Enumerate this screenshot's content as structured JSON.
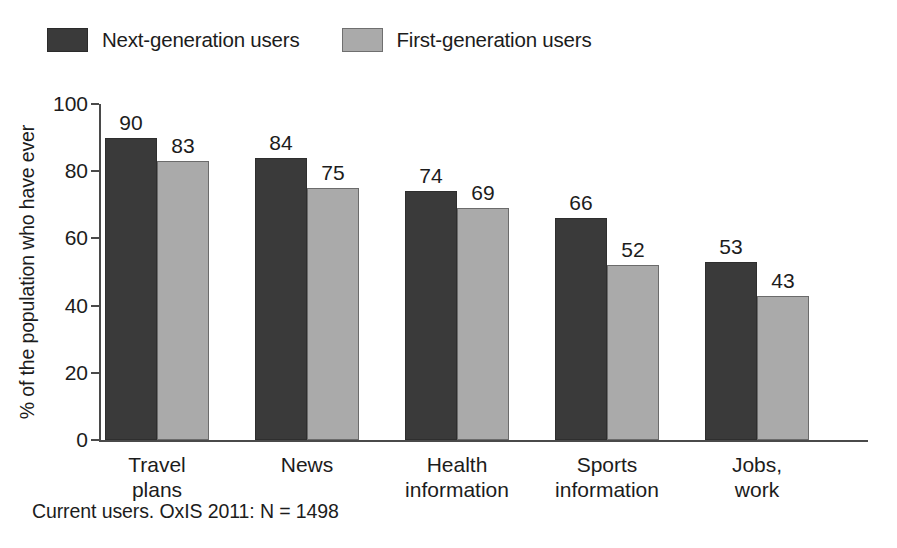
{
  "chart_data": {
    "type": "bar",
    "title": "",
    "subtitle": "",
    "xlabel": "",
    "ylabel": "% of the population who have ever",
    "ylim": [
      0,
      100
    ],
    "yticks": [
      0,
      20,
      40,
      60,
      80,
      100
    ],
    "ytick_labels": [
      "0",
      "20",
      "40",
      "60",
      "80",
      "100"
    ],
    "grid": false,
    "legend_position": "top-left",
    "categories": [
      "Travel\nplans",
      "News",
      "Health\ninformation",
      "Sports\ninformation",
      "Jobs,\nwork"
    ],
    "category_lines": [
      [
        "Travel",
        "plans"
      ],
      [
        "News",
        ""
      ],
      [
        "Health",
        "information"
      ],
      [
        "Sports",
        "information"
      ],
      [
        "Jobs,",
        "work"
      ]
    ],
    "series": [
      {
        "name": "Next-generation users",
        "color": "#3a3a3a",
        "values": [
          90,
          84,
          74,
          66,
          53
        ]
      },
      {
        "name": "First-generation users",
        "color": "#aaaaaa",
        "values": [
          83,
          75,
          69,
          52,
          43
        ]
      }
    ],
    "annotation": "Current users. OxIS 2011: N = 1498"
  },
  "legend": {
    "items": [
      {
        "label": "Next-generation users",
        "swatch": "dark-swatch-icon"
      },
      {
        "label": "First-generation users",
        "swatch": "light-swatch-icon"
      }
    ]
  },
  "footnote": {
    "text": "Current users. OxIS 2011: N = 1498"
  }
}
